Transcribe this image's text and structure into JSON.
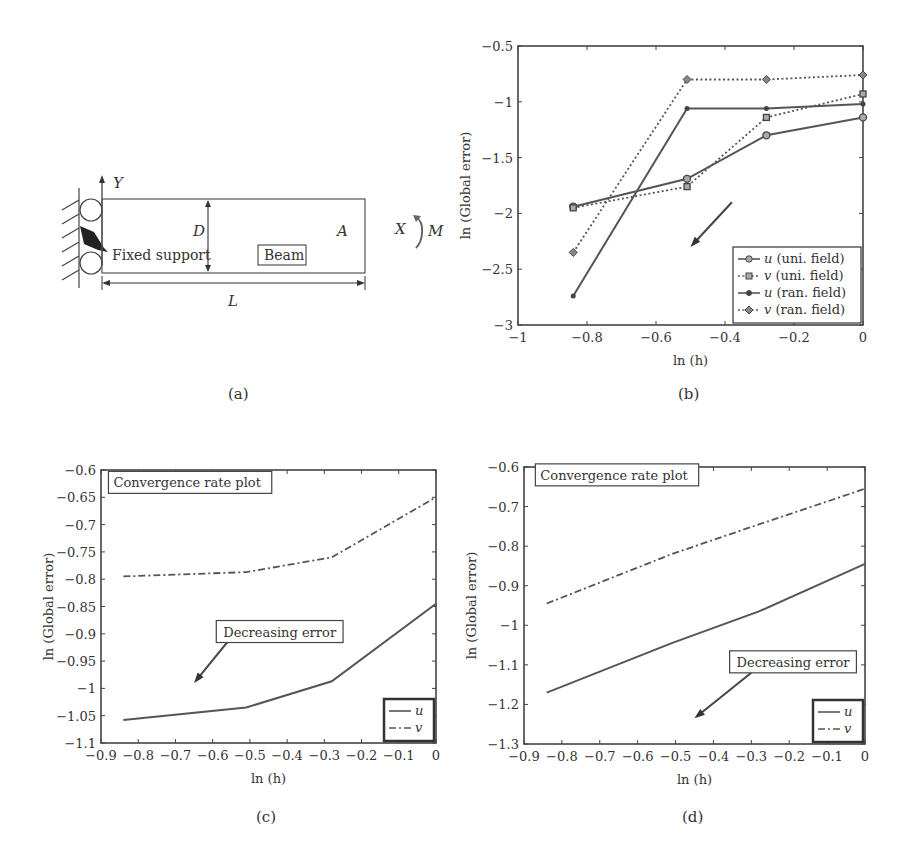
{
  "panel_a": {
    "caption": "(a)",
    "labels": {
      "y_axis": "Y",
      "x_axis": "X",
      "moment": "M",
      "depth": "D",
      "length": "L",
      "point": "A",
      "support": "Fixed support",
      "beam": "Beam"
    }
  },
  "chart_data": [
    {
      "id": "b",
      "type": "line",
      "caption": "(b)",
      "title": "",
      "xlabel": "ln (h)",
      "ylabel": "ln (Global error)",
      "xlim": [
        -1,
        0
      ],
      "ylim": [
        -3,
        -0.5
      ],
      "xticks": [
        -1,
        -0.8,
        -0.6,
        -0.4,
        -0.2,
        0
      ],
      "xtick_labels": [
        "−1",
        "−0.8",
        "−0.6",
        "−0.4",
        "−0.2",
        "0"
      ],
      "yticks": [
        -3,
        -2.5,
        -2,
        -1.5,
        -1,
        -0.5
      ],
      "ytick_labels": [
        "−3",
        "−2.5",
        "−2",
        "−1.5",
        "−1",
        "−0.5"
      ],
      "grid": false,
      "legend_position": "lower right",
      "x": [
        -0.84,
        -0.51,
        -0.28,
        0
      ],
      "series": [
        {
          "name": "u (uni. field)",
          "symbol": "u",
          "suffix": " (uni. field)",
          "style": "solid",
          "marker": "circle",
          "values": [
            -1.94,
            -1.69,
            -1.3,
            -1.14
          ]
        },
        {
          "name": "v (uni. field)",
          "symbol": "v",
          "suffix": " (uni. field)",
          "style": "dotted",
          "marker": "square",
          "values": [
            -1.95,
            -1.76,
            -1.14,
            -0.93
          ]
        },
        {
          "name": "u (ran. field)",
          "symbol": "u",
          "suffix": " (ran. field)",
          "style": "solid",
          "marker": "dot",
          "values": [
            -2.74,
            -1.06,
            -1.06,
            -1.02
          ]
        },
        {
          "name": "v (ran. field)",
          "symbol": "v",
          "suffix": " (ran. field)",
          "style": "dotted",
          "marker": "diamond",
          "values": [
            -2.35,
            -0.8,
            -0.8,
            -0.76
          ]
        }
      ],
      "annotations": [
        {
          "type": "arrow",
          "from": [
            -0.38,
            -1.9
          ],
          "to": [
            -0.5,
            -2.3
          ],
          "text": ""
        }
      ]
    },
    {
      "id": "c",
      "type": "line",
      "caption": "(c)",
      "title": "",
      "xlabel": "ln (h)",
      "ylabel": "ln (Global error)",
      "xlim": [
        -0.9,
        0
      ],
      "ylim": [
        -1.1,
        -0.6
      ],
      "xticks": [
        -0.9,
        -0.8,
        -0.7,
        -0.6,
        -0.5,
        -0.4,
        -0.3,
        -0.2,
        -0.1,
        0
      ],
      "xtick_labels": [
        "−0.9",
        "−0.8",
        "−0.7",
        "−0.6",
        "−0.5",
        "−0.4",
        "−0.3",
        "−0.2",
        "−0.1",
        "0"
      ],
      "yticks": [
        -1.1,
        -1.05,
        -1,
        -0.95,
        -0.9,
        -0.85,
        -0.8,
        -0.75,
        -0.7,
        -0.65,
        -0.6
      ],
      "ytick_labels": [
        "−1.1",
        "−1.05",
        "−1",
        "−0.95",
        "−0.9",
        "−0.85",
        "−0.8",
        "−0.75",
        "−0.7",
        "−0.65",
        "−0.6"
      ],
      "grid": false,
      "legend_position": "lower right",
      "x": [
        -0.84,
        -0.51,
        -0.28,
        0
      ],
      "series": [
        {
          "name": "u",
          "symbol": "u",
          "suffix": "",
          "style": "solid",
          "marker": "none",
          "values": [
            -1.058,
            -1.035,
            -0.987,
            -0.845
          ]
        },
        {
          "name": "v",
          "symbol": "v",
          "suffix": "",
          "style": "dashdot",
          "marker": "none",
          "values": [
            -0.795,
            -0.787,
            -0.76,
            -0.65
          ]
        }
      ],
      "annotations": [
        {
          "type": "box",
          "text": "Convergence rate plot",
          "at": [
            -0.88,
            -0.63
          ]
        },
        {
          "type": "arrow",
          "text": "Decreasing error",
          "text_at": [
            -0.42,
            -0.905
          ],
          "from": [
            -0.56,
            -0.915
          ],
          "to": [
            -0.65,
            -0.99
          ]
        }
      ]
    },
    {
      "id": "d",
      "type": "line",
      "caption": "(d)",
      "title": "",
      "xlabel": "ln (h)",
      "ylabel": "ln (Global error)",
      "xlim": [
        -0.9,
        0
      ],
      "ylim": [
        -1.3,
        -0.6
      ],
      "xticks": [
        -0.9,
        -0.8,
        -0.7,
        -0.6,
        -0.5,
        -0.4,
        -0.3,
        -0.2,
        -0.1,
        0
      ],
      "xtick_labels": [
        "−0.9",
        "−0.8",
        "−0.7",
        "−0.6",
        "−0.5",
        "−0.4",
        "−0.3",
        "−0.2",
        "−0.1",
        "0"
      ],
      "yticks": [
        -1.3,
        -1.2,
        -1.1,
        -1,
        -0.9,
        -0.8,
        -0.7,
        -0.6
      ],
      "ytick_labels": [
        "−1.3",
        "−1.2",
        "−1.1",
        "−1",
        "−0.9",
        "−0.8",
        "−0.7",
        "−0.6"
      ],
      "grid": false,
      "legend_position": "lower right",
      "x": [
        -0.84,
        -0.51,
        -0.28,
        0
      ],
      "series": [
        {
          "name": "u",
          "symbol": "u",
          "suffix": "",
          "style": "solid",
          "marker": "none",
          "values": [
            -1.17,
            -1.045,
            -0.965,
            -0.845
          ]
        },
        {
          "name": "v",
          "symbol": "v",
          "suffix": "",
          "style": "dashdot",
          "marker": "none",
          "values": [
            -0.945,
            -0.82,
            -0.745,
            -0.655
          ]
        }
      ],
      "annotations": [
        {
          "type": "box",
          "text": "Convergence rate plot",
          "at": [
            -0.87,
            -0.63
          ]
        },
        {
          "type": "arrow",
          "text": "Decreasing error",
          "text_at": [
            -0.19,
            -1.105
          ],
          "from": [
            -0.3,
            -1.12
          ],
          "to": [
            -0.45,
            -1.235
          ]
        }
      ]
    }
  ]
}
